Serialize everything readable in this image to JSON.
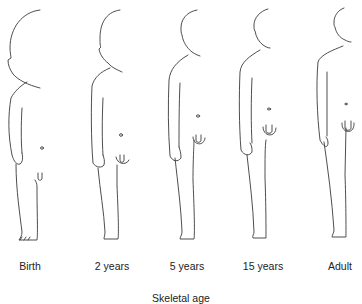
{
  "figure": {
    "stages": [
      {
        "id": "birth",
        "label": "Birth"
      },
      {
        "id": "2-years",
        "label": "2 years"
      },
      {
        "id": "5-years",
        "label": "5 years"
      },
      {
        "id": "15-years",
        "label": "15 years"
      },
      {
        "id": "adult",
        "label": "Adult"
      }
    ],
    "caption": "Skeletal age"
  }
}
